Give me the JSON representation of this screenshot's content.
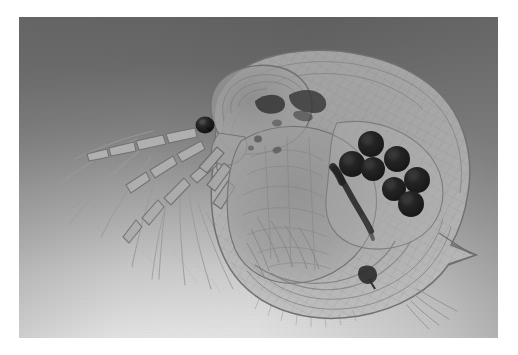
{
  "image": {
    "kind": "photograph",
    "medium": "light-microscopy",
    "subject": "Daphnia (water flea)",
    "orientation": "head-to-lower-left",
    "color_mode": "grayscale",
    "visible_text": "",
    "plate": {
      "left": 19,
      "top": 17,
      "width": 479,
      "height": 321,
      "border_color": "#ffffff"
    },
    "background": {
      "description": "even microscope field, grey at top grading to white at bottom-left",
      "top_color": "#8d8d8d",
      "mid_color": "#c4c4c4",
      "bottom_color": "#fafafa"
    },
    "specimen": {
      "body_fill": "#b9b9b9",
      "body_stroke": "#7e7e7e",
      "carapace_tint": "#a9a9a9",
      "dark_organ_color": "#2c2c2c",
      "setae_color": "#8a8a8a",
      "parts": [
        {
          "name": "compound-eye",
          "cx": 186,
          "cy": 108,
          "r": 9,
          "color": "#232323"
        },
        {
          "name": "head-shield",
          "description": "rounded head capsule above eye"
        },
        {
          "name": "rostrum",
          "description": "beak-like projection below eye"
        },
        {
          "name": "antennule",
          "description": "small sensory appendage at rostrum tip"
        },
        {
          "name": "second-antenna-upper-ramus",
          "segments": 4
        },
        {
          "name": "second-antenna-lower-ramus",
          "segments": 4
        },
        {
          "name": "swimming-setae",
          "count": 11,
          "description": "long feathery bristles sweeping down-left"
        },
        {
          "name": "carapace",
          "description": "large translucent bivalve shell enclosing body"
        },
        {
          "name": "carapace-reticulation",
          "description": "fine diamond mesh sculpturing on shell"
        },
        {
          "name": "tail-spine",
          "x": 455,
          "y": 238,
          "description": "posterior apical spine"
        },
        {
          "name": "brood-chamber",
          "description": "dorsal space holding developing embryos"
        },
        {
          "name": "gut",
          "description": "dark slanted digestive tract in mid-body"
        },
        {
          "name": "thoracic-limbs",
          "description": "feathery filter limbs along ventral body"
        },
        {
          "name": "post-abdominal-claw",
          "x": 348,
          "y": 258,
          "color": "#2b2b2b"
        },
        {
          "name": "caudal-setae",
          "count": 4,
          "description": "fine bristles at lower right shell margin"
        }
      ],
      "eggs": {
        "label": "embryos in brood pouch",
        "count": 7,
        "fill": "#1f1f1f",
        "positions": [
          {
            "cx": 352,
            "cy": 127,
            "r": 13
          },
          {
            "cx": 333,
            "cy": 147,
            "r": 13
          },
          {
            "cx": 354,
            "cy": 152,
            "r": 12
          },
          {
            "cx": 378,
            "cy": 142,
            "r": 13
          },
          {
            "cx": 375,
            "cy": 172,
            "r": 12
          },
          {
            "cx": 398,
            "cy": 163,
            "r": 13
          },
          {
            "cx": 392,
            "cy": 187,
            "r": 13
          }
        ]
      }
    }
  }
}
